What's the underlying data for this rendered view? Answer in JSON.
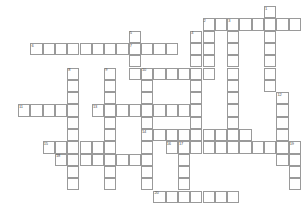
{
  "puzzle": {
    "title": "Crossword Puzzle Grid",
    "cell_size": 12.3,
    "origin_x": 18,
    "origin_y": 6,
    "columns": 23,
    "rows": 16,
    "cell_fill_color": "#ffffff",
    "cell_border_color": "#9a9a9a",
    "number_color": "#4a4a4a",
    "background_color": "#ffffff",
    "entries": [
      {
        "number": "1",
        "direction": "down",
        "row": 0,
        "col": 20,
        "length": 5
      },
      {
        "number": "2",
        "direction": "down",
        "row": 1,
        "col": 15,
        "length": 6
      },
      {
        "number": "3",
        "direction": "down",
        "row": 1,
        "col": 17,
        "length": 6
      },
      {
        "number": "3",
        "direction": "across",
        "row": 1,
        "col": 17,
        "length": 6
      },
      {
        "number": "2",
        "direction": "across",
        "row": 1,
        "col": 15,
        "length": 2
      },
      {
        "number": "4",
        "direction": "down",
        "row": 2,
        "col": 14,
        "length": 9
      },
      {
        "number": "5",
        "direction": "down",
        "row": 2,
        "col": 9,
        "length": 4
      },
      {
        "number": "6",
        "direction": "across",
        "row": 3,
        "col": 1,
        "length": 12
      },
      {
        "number": "7",
        "direction": "across",
        "row": 3,
        "col": 9,
        "length": 6
      },
      {
        "number": "8",
        "direction": "down",
        "row": 5,
        "col": 4,
        "length": 8
      },
      {
        "number": "9",
        "direction": "down",
        "row": 5,
        "col": 7,
        "length": 8
      },
      {
        "number": "10",
        "direction": "down",
        "row": 5,
        "col": 10,
        "length": 9
      },
      {
        "number": "10",
        "direction": "across",
        "row": 5,
        "col": 10,
        "length": 5
      },
      {
        "number": "11",
        "direction": "across",
        "row": 8,
        "col": 0,
        "length": 5
      },
      {
        "number": "12",
        "direction": "down",
        "row": 7,
        "col": 21,
        "length": 5
      },
      {
        "number": "13",
        "direction": "across",
        "row": 8,
        "col": 6,
        "length": 9
      },
      {
        "number": "14",
        "direction": "across",
        "row": 10,
        "col": 10,
        "length": 9
      },
      {
        "number": "15",
        "direction": "across",
        "row": 11,
        "col": 2,
        "length": 5
      },
      {
        "number": "16",
        "direction": "across",
        "row": 11,
        "col": 12,
        "length": 9
      },
      {
        "number": "17",
        "direction": "down",
        "row": 11,
        "col": 13,
        "length": 5
      },
      {
        "number": "18",
        "direction": "across",
        "row": 12,
        "col": 3,
        "length": 7
      },
      {
        "number": "19",
        "direction": "down",
        "row": 11,
        "col": 22,
        "length": 4
      },
      {
        "number": "20",
        "direction": "across",
        "row": 15,
        "col": 11,
        "length": 7
      }
    ],
    "cells": [
      {
        "row": 0,
        "col": 20,
        "number": "1"
      },
      {
        "row": 1,
        "col": 15,
        "number": "2"
      },
      {
        "row": 1,
        "col": 16,
        "number": ""
      },
      {
        "row": 1,
        "col": 17,
        "number": "3"
      },
      {
        "row": 1,
        "col": 18,
        "number": ""
      },
      {
        "row": 1,
        "col": 19,
        "number": ""
      },
      {
        "row": 1,
        "col": 20,
        "number": ""
      },
      {
        "row": 1,
        "col": 21,
        "number": ""
      },
      {
        "row": 1,
        "col": 22,
        "number": ""
      },
      {
        "row": 2,
        "col": 14,
        "number": "4"
      },
      {
        "row": 2,
        "col": 15,
        "number": ""
      },
      {
        "row": 2,
        "col": 17,
        "number": ""
      },
      {
        "row": 2,
        "col": 20,
        "number": ""
      },
      {
        "row": 2,
        "col": 9,
        "number": "5"
      },
      {
        "row": 3,
        "col": 1,
        "number": "6"
      },
      {
        "row": 3,
        "col": 2,
        "number": ""
      },
      {
        "row": 3,
        "col": 3,
        "number": ""
      },
      {
        "row": 3,
        "col": 4,
        "number": ""
      },
      {
        "row": 3,
        "col": 5,
        "number": ""
      },
      {
        "row": 3,
        "col": 6,
        "number": ""
      },
      {
        "row": 3,
        "col": 7,
        "number": ""
      },
      {
        "row": 3,
        "col": 8,
        "number": ""
      },
      {
        "row": 3,
        "col": 9,
        "number": "7"
      },
      {
        "row": 3,
        "col": 10,
        "number": ""
      },
      {
        "row": 3,
        "col": 11,
        "number": ""
      },
      {
        "row": 3,
        "col": 12,
        "number": ""
      },
      {
        "row": 3,
        "col": 14,
        "number": ""
      },
      {
        "row": 3,
        "col": 15,
        "number": ""
      },
      {
        "row": 3,
        "col": 17,
        "number": ""
      },
      {
        "row": 3,
        "col": 20,
        "number": ""
      },
      {
        "row": 4,
        "col": 9,
        "number": ""
      },
      {
        "row": 4,
        "col": 14,
        "number": ""
      },
      {
        "row": 4,
        "col": 15,
        "number": ""
      },
      {
        "row": 4,
        "col": 17,
        "number": ""
      },
      {
        "row": 4,
        "col": 20,
        "number": ""
      },
      {
        "row": 5,
        "col": 4,
        "number": "8"
      },
      {
        "row": 5,
        "col": 7,
        "number": "9"
      },
      {
        "row": 5,
        "col": 9,
        "number": ""
      },
      {
        "row": 5,
        "col": 10,
        "number": "10"
      },
      {
        "row": 5,
        "col": 11,
        "number": ""
      },
      {
        "row": 5,
        "col": 12,
        "number": ""
      },
      {
        "row": 5,
        "col": 13,
        "number": ""
      },
      {
        "row": 5,
        "col": 14,
        "number": ""
      },
      {
        "row": 5,
        "col": 15,
        "number": ""
      },
      {
        "row": 5,
        "col": 17,
        "number": ""
      },
      {
        "row": 5,
        "col": 20,
        "number": ""
      },
      {
        "row": 6,
        "col": 4,
        "number": ""
      },
      {
        "row": 6,
        "col": 7,
        "number": ""
      },
      {
        "row": 6,
        "col": 10,
        "number": ""
      },
      {
        "row": 6,
        "col": 14,
        "number": ""
      },
      {
        "row": 6,
        "col": 17,
        "number": ""
      },
      {
        "row": 6,
        "col": 20,
        "number": ""
      },
      {
        "row": 7,
        "col": 4,
        "number": ""
      },
      {
        "row": 7,
        "col": 7,
        "number": ""
      },
      {
        "row": 7,
        "col": 10,
        "number": ""
      },
      {
        "row": 7,
        "col": 14,
        "number": ""
      },
      {
        "row": 7,
        "col": 17,
        "number": ""
      },
      {
        "row": 7,
        "col": 21,
        "number": "12"
      },
      {
        "row": 8,
        "col": 0,
        "number": "11"
      },
      {
        "row": 8,
        "col": 1,
        "number": ""
      },
      {
        "row": 8,
        "col": 2,
        "number": ""
      },
      {
        "row": 8,
        "col": 3,
        "number": ""
      },
      {
        "row": 8,
        "col": 4,
        "number": ""
      },
      {
        "row": 8,
        "col": 6,
        "number": "13"
      },
      {
        "row": 8,
        "col": 7,
        "number": ""
      },
      {
        "row": 8,
        "col": 8,
        "number": ""
      },
      {
        "row": 8,
        "col": 9,
        "number": ""
      },
      {
        "row": 8,
        "col": 10,
        "number": ""
      },
      {
        "row": 8,
        "col": 11,
        "number": ""
      },
      {
        "row": 8,
        "col": 12,
        "number": ""
      },
      {
        "row": 8,
        "col": 13,
        "number": ""
      },
      {
        "row": 8,
        "col": 14,
        "number": ""
      },
      {
        "row": 8,
        "col": 17,
        "number": ""
      },
      {
        "row": 8,
        "col": 21,
        "number": ""
      },
      {
        "row": 9,
        "col": 4,
        "number": ""
      },
      {
        "row": 9,
        "col": 7,
        "number": ""
      },
      {
        "row": 9,
        "col": 10,
        "number": ""
      },
      {
        "row": 9,
        "col": 14,
        "number": ""
      },
      {
        "row": 9,
        "col": 17,
        "number": ""
      },
      {
        "row": 9,
        "col": 21,
        "number": ""
      },
      {
        "row": 10,
        "col": 4,
        "number": ""
      },
      {
        "row": 10,
        "col": 7,
        "number": ""
      },
      {
        "row": 10,
        "col": 10,
        "number": "14"
      },
      {
        "row": 10,
        "col": 11,
        "number": ""
      },
      {
        "row": 10,
        "col": 12,
        "number": ""
      },
      {
        "row": 10,
        "col": 13,
        "number": ""
      },
      {
        "row": 10,
        "col": 14,
        "number": ""
      },
      {
        "row": 10,
        "col": 15,
        "number": ""
      },
      {
        "row": 10,
        "col": 16,
        "number": ""
      },
      {
        "row": 10,
        "col": 17,
        "number": ""
      },
      {
        "row": 10,
        "col": 18,
        "number": ""
      },
      {
        "row": 10,
        "col": 21,
        "number": ""
      },
      {
        "row": 11,
        "col": 2,
        "number": "15"
      },
      {
        "row": 11,
        "col": 3,
        "number": ""
      },
      {
        "row": 11,
        "col": 4,
        "number": ""
      },
      {
        "row": 11,
        "col": 5,
        "number": ""
      },
      {
        "row": 11,
        "col": 6,
        "number": ""
      },
      {
        "row": 11,
        "col": 7,
        "number": ""
      },
      {
        "row": 11,
        "col": 10,
        "number": ""
      },
      {
        "row": 11,
        "col": 12,
        "number": "16"
      },
      {
        "row": 11,
        "col": 13,
        "number": "17"
      },
      {
        "row": 11,
        "col": 14,
        "number": ""
      },
      {
        "row": 11,
        "col": 15,
        "number": ""
      },
      {
        "row": 11,
        "col": 16,
        "number": ""
      },
      {
        "row": 11,
        "col": 17,
        "number": ""
      },
      {
        "row": 11,
        "col": 18,
        "number": ""
      },
      {
        "row": 11,
        "col": 19,
        "number": ""
      },
      {
        "row": 11,
        "col": 20,
        "number": ""
      },
      {
        "row": 11,
        "col": 21,
        "number": ""
      },
      {
        "row": 11,
        "col": 22,
        "number": "19"
      },
      {
        "row": 12,
        "col": 3,
        "number": "18"
      },
      {
        "row": 12,
        "col": 4,
        "number": ""
      },
      {
        "row": 12,
        "col": 5,
        "number": ""
      },
      {
        "row": 12,
        "col": 6,
        "number": ""
      },
      {
        "row": 12,
        "col": 7,
        "number": ""
      },
      {
        "row": 12,
        "col": 8,
        "number": ""
      },
      {
        "row": 12,
        "col": 9,
        "number": ""
      },
      {
        "row": 12,
        "col": 10,
        "number": ""
      },
      {
        "row": 12,
        "col": 13,
        "number": ""
      },
      {
        "row": 12,
        "col": 21,
        "number": ""
      },
      {
        "row": 12,
        "col": 22,
        "number": ""
      },
      {
        "row": 13,
        "col": 4,
        "number": ""
      },
      {
        "row": 13,
        "col": 7,
        "number": ""
      },
      {
        "row": 13,
        "col": 10,
        "number": ""
      },
      {
        "row": 13,
        "col": 13,
        "number": ""
      },
      {
        "row": 13,
        "col": 22,
        "number": ""
      },
      {
        "row": 14,
        "col": 4,
        "number": ""
      },
      {
        "row": 14,
        "col": 7,
        "number": ""
      },
      {
        "row": 14,
        "col": 10,
        "number": ""
      },
      {
        "row": 14,
        "col": 13,
        "number": ""
      },
      {
        "row": 14,
        "col": 22,
        "number": ""
      },
      {
        "row": 15,
        "col": 11,
        "number": "20"
      },
      {
        "row": 15,
        "col": 12,
        "number": ""
      },
      {
        "row": 15,
        "col": 13,
        "number": ""
      },
      {
        "row": 15,
        "col": 14,
        "number": ""
      },
      {
        "row": 15,
        "col": 15,
        "number": ""
      },
      {
        "row": 15,
        "col": 16,
        "number": ""
      },
      {
        "row": 15,
        "col": 17,
        "number": ""
      }
    ]
  }
}
